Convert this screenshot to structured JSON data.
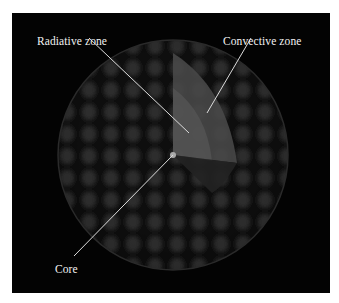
{
  "figure": {
    "labels": {
      "radiative": "Radiative zone",
      "convective": "Convective zone",
      "core": "Core"
    }
  }
}
